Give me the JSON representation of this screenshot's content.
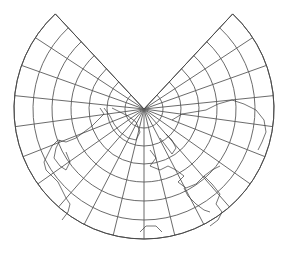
{
  "map": {
    "type": "conic-projection",
    "center_feature": "north-pole",
    "width": 290,
    "height": 254,
    "background": "#ffffff",
    "line_color": "#4a4a4a",
    "pole": {
      "x": 144,
      "y": 109
    },
    "outer_radius": 130,
    "gap_start_deg": -133,
    "gap_end_deg": -47,
    "ring_radii": [
      19,
      37,
      55,
      73,
      92,
      111,
      130
    ],
    "spoke_step_deg": 13.7
  },
  "coastlines": [
    {
      "name": "north-america",
      "points": [
        [
          100,
          108
        ],
        [
          104,
          114
        ],
        [
          98,
          120
        ],
        [
          92,
          126
        ],
        [
          84,
          132
        ],
        [
          76,
          138
        ],
        [
          66,
          142
        ],
        [
          58,
          140
        ],
        [
          52,
          146
        ],
        [
          48,
          154
        ],
        [
          44,
          162
        ],
        [
          46,
          170
        ],
        [
          52,
          176
        ],
        [
          58,
          182
        ],
        [
          62,
          190
        ],
        [
          66,
          198
        ],
        [
          70,
          204
        ],
        [
          68,
          212
        ],
        [
          62,
          220
        ]
      ]
    },
    {
      "name": "hudson-bay",
      "points": [
        [
          60,
          140
        ],
        [
          56,
          148
        ],
        [
          54,
          158
        ],
        [
          60,
          166
        ],
        [
          66,
          170
        ],
        [
          70,
          162
        ],
        [
          66,
          152
        ]
      ]
    },
    {
      "name": "greenland",
      "points": [
        [
          104,
          108
        ],
        [
          110,
          116
        ],
        [
          114,
          124
        ],
        [
          120,
          132
        ],
        [
          128,
          138
        ],
        [
          136,
          140
        ],
        [
          140,
          132
        ],
        [
          136,
          122
        ],
        [
          128,
          116
        ],
        [
          120,
          112
        ],
        [
          112,
          108
        ]
      ]
    },
    {
      "name": "europe",
      "points": [
        [
          150,
          150
        ],
        [
          156,
          158
        ],
        [
          150,
          166
        ],
        [
          160,
          170
        ],
        [
          168,
          166
        ],
        [
          176,
          170
        ],
        [
          184,
          176
        ],
        [
          178,
          182
        ],
        [
          186,
          188
        ],
        [
          196,
          184
        ],
        [
          204,
          176
        ],
        [
          212,
          170
        ],
        [
          220,
          166
        ]
      ]
    },
    {
      "name": "scandinavia",
      "points": [
        [
          160,
          138
        ],
        [
          166,
          146
        ],
        [
          172,
          154
        ],
        [
          176,
          148
        ],
        [
          172,
          140
        ],
        [
          166,
          134
        ]
      ]
    },
    {
      "name": "asia-north",
      "points": [
        [
          172,
          120
        ],
        [
          182,
          114
        ],
        [
          194,
          112
        ],
        [
          206,
          110
        ],
        [
          218,
          104
        ],
        [
          232,
          100
        ],
        [
          244,
          104
        ],
        [
          256,
          110
        ],
        [
          264,
          120
        ],
        [
          266,
          132
        ],
        [
          262,
          142
        ],
        [
          258,
          150
        ]
      ]
    },
    {
      "name": "asia-south",
      "points": [
        [
          204,
          176
        ],
        [
          212,
          184
        ],
        [
          220,
          194
        ],
        [
          216,
          204
        ],
        [
          222,
          212
        ],
        [
          218,
          220
        ],
        [
          210,
          226
        ]
      ]
    },
    {
      "name": "africa-north",
      "points": [
        [
          140,
          232
        ],
        [
          146,
          226
        ],
        [
          156,
          226
        ],
        [
          162,
          232
        ]
      ]
    },
    {
      "name": "arabian-coast",
      "points": [
        [
          184,
          188
        ],
        [
          188,
          196
        ],
        [
          196,
          204
        ],
        [
          204,
          210
        ],
        [
          210,
          212
        ]
      ]
    }
  ]
}
